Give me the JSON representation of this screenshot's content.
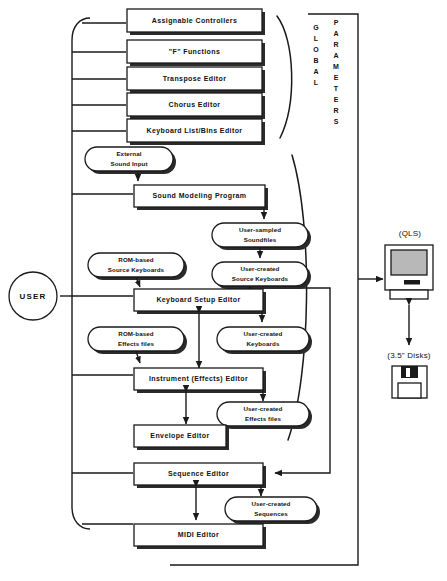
{
  "diagram": {
    "actor": {
      "label": "USER"
    },
    "global_group": {
      "label_line1": "GLOBAL",
      "label_line2": "PARAMETERS"
    },
    "global_boxes": [
      {
        "id": "assignable-controllers",
        "label": "Assignable  Controllers"
      },
      {
        "id": "f-functions",
        "label": "\"F\"  Functions"
      },
      {
        "id": "transpose-editor",
        "label": "Transpose  Editor"
      },
      {
        "id": "chorus-editor",
        "label": "Chorus  Editor"
      },
      {
        "id": "keyboard-list-bins-editor",
        "label": "Keyboard  List/Bins  Editor"
      }
    ],
    "editor_boxes": [
      {
        "id": "sound-modeling-program",
        "label": "Sound  Modeling  Program"
      },
      {
        "id": "keyboard-setup-editor",
        "label": "Keyboard  Setup  Editor"
      },
      {
        "id": "instrument-effects-editor",
        "label": "Instrument  (Effects)  Editor"
      },
      {
        "id": "envelope-editor",
        "label": "Envelope  Editor"
      },
      {
        "id": "sequence-editor",
        "label": "Sequence  Editor"
      },
      {
        "id": "midi-editor",
        "label": "MIDI  Editor"
      }
    ],
    "data_nodes": [
      {
        "id": "external-sound-input",
        "line1": "External",
        "line2": "Sound Input"
      },
      {
        "id": "user-sampled-soundfiles",
        "line1": "User-sampled",
        "line2": "Soundfiles"
      },
      {
        "id": "rom-based-source-keyboards",
        "line1": "ROM-based",
        "line2": "Source Keyboards"
      },
      {
        "id": "user-created-source-keyboards",
        "line1": "User-created",
        "line2": "Source Keyboards"
      },
      {
        "id": "rom-based-effects-files",
        "line1": "ROM-based",
        "line2": "Effects files"
      },
      {
        "id": "user-created-keyboards",
        "line1": "User-created",
        "line2": "Keyboards"
      },
      {
        "id": "user-created-effects-files",
        "line1": "User-created",
        "line2": "Effects files"
      },
      {
        "id": "user-created-sequences",
        "line1": "User-created",
        "line2": "Sequences"
      }
    ],
    "devices": [
      {
        "id": "qls-computer",
        "label": "(QLS)",
        "icon": "computer-icon"
      },
      {
        "id": "floppy-disks",
        "label": "(3.5\" Disks)",
        "icon": "floppy-disk-icon"
      }
    ],
    "colors": {
      "stroke": "#1a1a1a",
      "fill": "#ffffff",
      "shadow": "#2b2b2b",
      "screen": "#b8b8b8"
    }
  }
}
